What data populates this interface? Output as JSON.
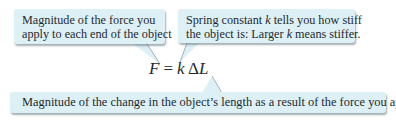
{
  "callouts": {
    "force": {
      "lines": [
        "Magnitude of the force you",
        "apply to each end of the object"
      ]
    },
    "spring_constant": {
      "line1_pre": "Spring constant ",
      "line1_k": "k",
      "line1_post": " tells you how stiff",
      "line2_pre": "the object is: Larger ",
      "line2_k": "k",
      "line2_post": " means stiffer."
    },
    "length_change": {
      "text": "Magnitude of the change in the object’s length as a result of the force you apply"
    }
  },
  "equation": {
    "lhs": "F",
    "equals": "=",
    "k": "k",
    "delta": "Δ",
    "L": "L"
  },
  "colors": {
    "callout_fill": "#dcf0f6",
    "callout_shadow": "#5a6e78",
    "text": "#1e2a30"
  }
}
